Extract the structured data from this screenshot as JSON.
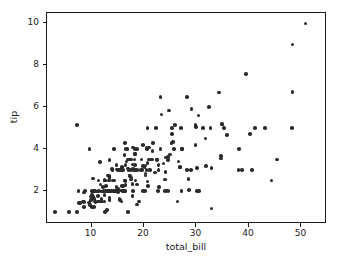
{
  "chart_data": {
    "type": "scatter",
    "title": "",
    "xlabel": "total_bill",
    "ylabel": "tip",
    "xlim": [
      1.5,
      54.5
    ],
    "ylim": [
      0.52,
      10.5
    ],
    "xticks": [
      10,
      20,
      30,
      40,
      50
    ],
    "yticks": [
      2,
      4,
      6,
      8,
      10
    ],
    "grid": false,
    "legend": null,
    "marker_color": "#2b2b2b",
    "marker_size_px": 3.6,
    "axes_color": "#1a1a1a",
    "background_color": "#ffffff",
    "series": [
      {
        "name": "tips",
        "x": [
          16.99,
          10.34,
          21.01,
          23.68,
          24.59,
          25.29,
          8.77,
          26.88,
          15.04,
          14.78,
          10.27,
          35.26,
          15.42,
          18.43,
          14.83,
          21.58,
          10.33,
          16.29,
          16.97,
          20.65,
          17.92,
          20.29,
          15.77,
          39.42,
          19.82,
          17.81,
          13.37,
          12.69,
          21.7,
          19.65,
          9.55,
          18.35,
          15.06,
          20.69,
          17.78,
          24.06,
          16.31,
          16.93,
          18.69,
          31.27,
          16.04,
          17.46,
          13.94,
          9.68,
          30.4,
          18.29,
          22.23,
          32.4,
          28.55,
          18.04,
          12.54,
          10.29,
          34.81,
          9.94,
          25.56,
          19.49,
          38.01,
          26.41,
          11.24,
          48.27,
          20.29,
          13.81,
          11.02,
          18.29,
          17.59,
          20.08,
          16.45,
          3.07,
          20.23,
          15.01,
          12.02,
          17.07,
          26.86,
          25.28,
          14.73,
          10.51,
          17.92,
          27.2,
          22.76,
          17.29,
          19.44,
          16.66,
          10.07,
          32.68,
          15.98,
          34.83,
          13.03,
          18.28,
          24.71,
          21.16,
          28.97,
          22.49,
          5.75,
          16.32,
          22.75,
          40.17,
          27.28,
          12.03,
          21.01,
          12.46,
          11.35,
          15.38,
          44.3,
          22.42,
          20.92,
          15.36,
          20.49,
          25.21,
          18.24,
          14.31,
          14.0,
          7.25,
          38.07,
          23.95,
          25.71,
          17.31,
          29.93,
          10.65,
          12.43,
          24.08,
          11.69,
          13.42,
          14.26,
          15.95,
          12.48,
          29.8,
          8.52,
          14.52,
          11.38,
          22.82,
          19.08,
          20.27,
          11.17,
          12.26,
          18.26,
          8.51,
          10.33,
          14.15,
          16.0,
          13.16,
          17.47,
          34.3,
          41.19,
          27.05,
          16.43,
          8.35,
          18.64,
          11.87,
          9.78,
          7.51,
          14.07,
          13.13,
          17.26,
          24.55,
          19.77,
          29.85,
          48.17,
          25.0,
          13.39,
          16.49,
          21.5,
          12.66,
          16.21,
          13.81,
          17.51,
          24.52,
          20.76,
          31.71,
          10.59,
          10.63,
          50.81,
          15.81,
          7.25,
          31.85,
          16.82,
          32.9,
          17.89,
          14.48,
          9.6,
          34.63,
          34.65,
          23.33,
          45.35,
          23.17,
          40.55,
          20.69,
          20.9,
          30.46,
          18.15,
          23.1,
          15.69,
          19.81,
          28.44,
          15.48,
          16.58,
          7.56,
          10.34,
          43.11,
          13.0,
          13.51,
          18.71,
          12.74,
          13.0,
          16.4,
          20.53,
          16.47,
          26.59,
          38.73,
          24.27,
          12.76,
          30.06,
          25.89,
          48.33,
          13.27,
          28.17,
          12.9,
          28.15,
          11.59,
          7.74,
          30.14,
          12.16,
          13.42,
          8.58,
          15.98,
          13.42,
          16.27,
          10.09,
          20.45,
          13.28,
          22.12,
          24.01,
          15.69,
          11.61,
          10.77,
          15.53,
          10.07,
          12.6,
          32.83,
          35.83,
          29.03,
          27.18,
          22.67,
          17.82,
          18.78
        ],
        "y": [
          1.01,
          1.66,
          3.5,
          3.31,
          3.61,
          4.71,
          2.0,
          3.12,
          1.96,
          3.23,
          1.71,
          5.0,
          1.57,
          3.0,
          3.02,
          3.92,
          1.67,
          3.71,
          3.5,
          3.35,
          4.08,
          2.75,
          2.23,
          7.58,
          3.18,
          2.34,
          2.0,
          2.0,
          4.3,
          3.0,
          1.45,
          2.5,
          3.0,
          2.45,
          3.27,
          3.6,
          2.0,
          3.07,
          2.31,
          5.0,
          2.24,
          2.54,
          3.06,
          1.32,
          5.6,
          3.0,
          5.0,
          6.0,
          2.05,
          3.0,
          2.5,
          2.6,
          5.2,
          1.56,
          4.34,
          3.51,
          3.0,
          1.5,
          1.76,
          6.73,
          3.21,
          2.0,
          1.98,
          3.76,
          2.64,
          3.15,
          2.47,
          1.0,
          2.01,
          2.09,
          1.97,
          3.0,
          3.14,
          5.0,
          2.2,
          1.25,
          3.08,
          4.0,
          3.0,
          2.71,
          3.0,
          3.4,
          1.83,
          5.0,
          2.03,
          5.17,
          2.0,
          4.0,
          5.85,
          3.0,
          3.0,
          3.5,
          1.0,
          4.3,
          3.25,
          4.73,
          4.0,
          1.5,
          3.0,
          1.5,
          2.5,
          3.0,
          2.5,
          3.48,
          4.08,
          1.64,
          4.06,
          4.29,
          3.76,
          4.0,
          3.0,
          1.0,
          4.0,
          2.55,
          4.0,
          3.5,
          5.07,
          1.5,
          1.8,
          2.92,
          2.31,
          1.68,
          2.5,
          2.0,
          2.52,
          4.2,
          1.48,
          2.0,
          2.0,
          2.18,
          1.5,
          2.83,
          1.5,
          2.0,
          3.25,
          1.25,
          2.0,
          2.0,
          2.0,
          2.75,
          3.5,
          6.7,
          5.0,
          5.0,
          2.3,
          1.5,
          1.36,
          1.63,
          1.73,
          2.0,
          2.5,
          2.0,
          2.74,
          2.0,
          2.0,
          5.14,
          5.0,
          3.75,
          2.61,
          2.0,
          3.5,
          2.5,
          2.0,
          2.0,
          3.0,
          3.48,
          2.24,
          4.5,
          1.61,
          2.0,
          10.0,
          3.16,
          5.15,
          3.18,
          4.0,
          3.11,
          2.0,
          2.0,
          4.0,
          3.55,
          3.68,
          5.65,
          3.5,
          6.5,
          3.0,
          5.0,
          3.5,
          2.0,
          3.5,
          4.0,
          1.5,
          4.19,
          2.56,
          2.02,
          4.0,
          1.44,
          2.0,
          5.0,
          2.0,
          2.0,
          4.0,
          2.01,
          2.0,
          2.5,
          4.0,
          3.23,
          3.41,
          3.0,
          2.03,
          2.23,
          2.0,
          5.16,
          9.0,
          2.5,
          6.5,
          1.1,
          3.0,
          1.5,
          1.44,
          3.09,
          2.2,
          3.48,
          1.92,
          3.0,
          1.58,
          2.5,
          2.0,
          3.0,
          2.72,
          2.88,
          2.0,
          3.0,
          3.39,
          1.47,
          3.0,
          1.25,
          1.0,
          1.17,
          4.67,
          5.92,
          2.0,
          2.0,
          1.75,
          3.0
        ]
      }
    ]
  },
  "axis": {
    "xlabel": "total_bill",
    "ylabel": "tip",
    "xtick_labels": [
      "10",
      "20",
      "30",
      "40",
      "50"
    ],
    "ytick_labels": [
      "2",
      "4",
      "6",
      "8",
      "10"
    ]
  }
}
